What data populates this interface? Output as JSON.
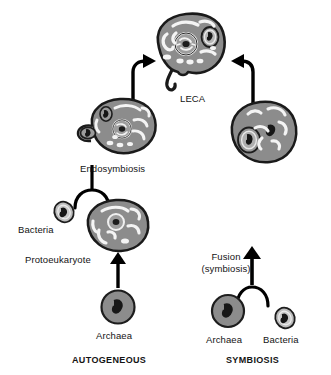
{
  "figure": {
    "title_present": false,
    "background": "#ffffff"
  },
  "palette": {
    "cell_fill": "#8c8c8c",
    "cell_stroke": "#1a1a1a",
    "bacteria_fill": "#bdbdbd",
    "organelle_light": "#f2f2f2",
    "nucleus_fill": "#a8a8a8",
    "dark_ink": "#141414",
    "arrow": "#000000"
  },
  "labels": {
    "leca": "LECA",
    "endosymbiosis": "Endosymbiosis",
    "bacteria_left": "Bacteria",
    "protoeukaryote": "Protoeukaryote",
    "archaea_left": "Archaea",
    "fusion_line1": "Fusion",
    "fusion_line2": "(symbiosis)",
    "archaea_right": "Archaea",
    "bacteria_right": "Bacteria",
    "pathway_left": "AUTOGENEOUS",
    "pathway_right": "SYMBIOSIS"
  },
  "pathways": [
    {
      "name": "AUTOGENEOUS",
      "side": "left",
      "steps": [
        {
          "order": 1,
          "node": "Archaea",
          "type": "cell"
        },
        {
          "order": 2,
          "node": "Protoeukaryote",
          "type": "cell"
        },
        {
          "order": 3,
          "node": "Bacteria",
          "type": "cell",
          "role": "engulfed-partner"
        },
        {
          "order": 4,
          "node": "Endosymbiosis",
          "type": "process"
        },
        {
          "order": 5,
          "node": "LECA",
          "type": "cell"
        }
      ]
    },
    {
      "name": "SYMBIOSIS",
      "side": "right",
      "steps": [
        {
          "order": 1,
          "node": "Archaea",
          "type": "cell"
        },
        {
          "order": 2,
          "node": "Bacteria",
          "type": "cell",
          "role": "fusion-partner"
        },
        {
          "order": 3,
          "node": "Fusion (symbiosis)",
          "type": "process"
        },
        {
          "order": 4,
          "node": "LECA",
          "type": "cell"
        }
      ]
    }
  ],
  "cells": {
    "leca": {
      "name": "LECA",
      "features": [
        "nucleus",
        "mitochondria",
        "vesicles",
        "endomembrane",
        "flagellum"
      ]
    },
    "endosymbiont_cell": {
      "name": "Endosymbiosis intermediate",
      "features": [
        "nucleus",
        "engulfed bacterium",
        "endomembrane",
        "vesicles"
      ]
    },
    "fusion_cell": {
      "name": "Fusion cell",
      "features": [
        "engulfed bacterium",
        "nucleoid",
        "tubules"
      ]
    },
    "protoeukaryote": {
      "name": "Protoeukaryote",
      "features": [
        "nucleus",
        "endomembrane",
        "vesicle"
      ]
    },
    "archaea": {
      "name": "Archaea",
      "features": [
        "nucleoid"
      ]
    },
    "bacteria": {
      "name": "Bacteria",
      "features": [
        "nucleoid"
      ]
    }
  }
}
